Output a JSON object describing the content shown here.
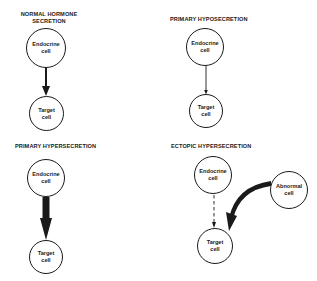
{
  "panels": [
    {
      "title_line1": "NORMAL HORMONE",
      "title_line2": "SECRETION",
      "source_cell": {
        "line1": "Endocrine",
        "line2": "cell"
      },
      "target_cell": {
        "line1": "Target",
        "line2": "cell"
      },
      "arrow": "medium-solid"
    },
    {
      "title_line1": "PRIMARY HYPOSECRETION",
      "source_cell": {
        "line1": "Endocrine",
        "line2": "cell"
      },
      "target_cell": {
        "line1": "Target",
        "line2": "cell"
      },
      "arrow": "thin-solid"
    },
    {
      "title_line1": "PRIMARY HYPERSECRETION",
      "source_cell": {
        "line1": "Endocrine",
        "line2": "cell"
      },
      "target_cell": {
        "line1": "Target",
        "line2": "cell"
      },
      "arrow": "thick-solid"
    },
    {
      "title_line1": "ECTOPIC HYPERSECRETION",
      "source_cell": {
        "line1": "Endocrine",
        "line2": "cell"
      },
      "abnormal_cell": {
        "line1": "Abnormal",
        "line2": "cell"
      },
      "target_cell": {
        "line1": "Target",
        "line2": "cell"
      },
      "arrow": "dashed-thin",
      "abnormal_arrow": "thick-curved"
    }
  ]
}
